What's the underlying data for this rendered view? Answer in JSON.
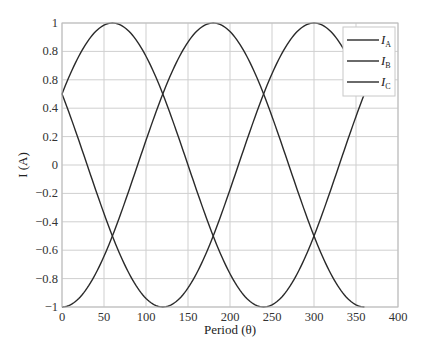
{
  "chart_data": {
    "type": "line",
    "title": "",
    "xlabel": "Period (θ)",
    "ylabel": "I (A)",
    "xlim": [
      0,
      400
    ],
    "ylim": [
      -1,
      1
    ],
    "grid": true,
    "legend_position": "upper right",
    "x_ticks": [
      "0",
      "50",
      "100",
      "150",
      "200",
      "250",
      "300",
      "350",
      "400"
    ],
    "y_ticks": [
      "1",
      "0.8",
      "0.8",
      "0.4",
      "0.2",
      "0",
      "−0.2",
      "−0.4",
      "−0.6",
      "−0.8",
      "−1"
    ],
    "x": [
      0,
      30,
      60,
      90,
      120,
      150,
      180,
      210,
      240,
      270,
      300,
      330,
      360
    ],
    "series": [
      {
        "name": "I_A",
        "label_main": "I",
        "label_sub": "A",
        "phase_deg": 60,
        "values": [
          0.5,
          0.866,
          1,
          0.866,
          0.5,
          0,
          -0.5,
          -0.866,
          -1,
          -0.866,
          -0.5,
          0,
          0.5
        ]
      },
      {
        "name": "I_B",
        "label_main": "I",
        "label_sub": "B",
        "phase_deg": 180,
        "values": [
          -1,
          -0.866,
          -0.5,
          0,
          0.5,
          0.866,
          1,
          0.866,
          0.5,
          0,
          -0.5,
          -0.866,
          -1
        ]
      },
      {
        "name": "I_C",
        "label_main": "I",
        "label_sub": "C",
        "phase_deg": 300,
        "values": [
          0.5,
          0,
          -0.5,
          -0.866,
          -1,
          -0.866,
          -0.5,
          0,
          0.5,
          0.866,
          1,
          0.866,
          0.5
        ]
      }
    ],
    "colors": {
      "line": "#2a2a2a",
      "grid": "#cfcfcf",
      "frame": "#bdbdbd"
    }
  }
}
